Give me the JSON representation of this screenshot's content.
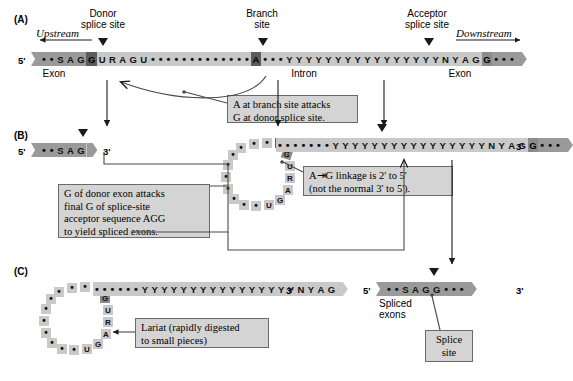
{
  "figure": {
    "panels": [
      "(A)",
      "(B)",
      "(C)"
    ],
    "prime5": "5'",
    "prime3": "3'"
  },
  "panelA": {
    "letter": "(A)",
    "upstream_label": "Upstream",
    "downstream_label": "Downstream",
    "donor_label": "Donor\nsplice site",
    "branch_label": "Branch\nsite",
    "acceptor_label": "Acceptor\nsplice site",
    "exon_left_label": "Exon",
    "exon_right_label": "Exon",
    "intron_label": "Intron",
    "callout": "A at branch site attacks\nG at donor splice site.",
    "sequence": {
      "exon_left": [
        "•",
        "•",
        "S",
        "A",
        "G"
      ],
      "donor_G": "G",
      "intron_start": [
        "U",
        "R",
        "A",
        "G",
        "U"
      ],
      "intron_dots_1": 13,
      "branch_A": "A",
      "intron_dots_2": 3,
      "pyrimidine_tract": [
        "Y",
        "Y",
        "Y",
        "Y",
        "Y",
        "Y",
        "Y",
        "Y",
        "Y",
        "Y",
        "Y",
        "Y",
        "Y",
        "Y",
        "Y",
        "Y",
        "N",
        "Y",
        "A",
        "G"
      ],
      "acceptor_G": "G",
      "exon_right_dots": 3
    }
  },
  "panelB": {
    "letter": "(B)",
    "callout_left": "G of donor exon attacks\nfinal G of splice-site\nacceptor sequence AGG\nto yield spliced exons.",
    "callout_right": "A⇥G linkage is 2' to 5'\n(not the normal 3' to 5').",
    "callout_right_line1": "A",
    "callout_right_line1b": "G linkage is 2' to 5'",
    "callout_right_line2": "(not the normal 3' to 5').",
    "donor_exon": [
      "•",
      "•",
      "S",
      "A",
      "G"
    ],
    "lariat": {
      "branch_A": "A",
      "tail": [
        "G",
        "U",
        "R",
        "A",
        "G",
        "U"
      ],
      "loop_dots": 14
    },
    "right_strand": {
      "leading_dots": 3,
      "branch_A": "A",
      "dots_after_A": 3,
      "pyrimidine_tract": [
        "Y",
        "Y",
        "Y",
        "Y",
        "Y",
        "Y",
        "Y",
        "Y",
        "Y",
        "Y",
        "Y",
        "Y",
        "Y",
        "Y",
        "Y",
        "Y",
        "N",
        "Y",
        "A",
        "G"
      ],
      "acceptor_G": "G",
      "exon_dots": 3
    }
  },
  "panelC": {
    "letter": "(C)",
    "callout_lariat": "Lariat (rapidly digested\nto small pieces)",
    "callout_splice_site": "Splice\nsite",
    "spliced_exons_label": "Spliced\nexons",
    "lariat": {
      "branch_A": "A",
      "tail": [
        "G",
        "U",
        "R",
        "A",
        "G",
        "U"
      ],
      "loop_dots": 14
    },
    "intron_strand": {
      "lead_dots": 3,
      "branch_A": "A",
      "dots_after_A": 3,
      "pyrimidine_tract": [
        "Y",
        "Y",
        "Y",
        "Y",
        "Y",
        "Y",
        "Y",
        "Y",
        "Y",
        "Y",
        "Y",
        "Y",
        "Y",
        "Y",
        "Y",
        "Y",
        "N",
        "Y",
        "A",
        "G"
      ]
    },
    "spliced": {
      "sequence": [
        "•",
        "•",
        "S",
        "A",
        "G",
        "G",
        "•",
        "•",
        "•"
      ]
    }
  },
  "colors": {
    "exon": "#9a9a9a",
    "intron": "#c9c9c9",
    "highlight_dark": "#5d5d5d",
    "highlight_mid": "#8b8b8b",
    "callout_bg": "#d4d4d4",
    "callout_border": "#6a6a6a",
    "ink": "#1a1a1a"
  }
}
